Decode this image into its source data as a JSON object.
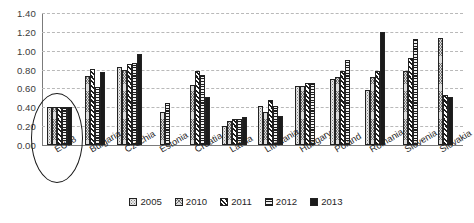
{
  "chart_data": {
    "type": "bar",
    "title": "",
    "xlabel": "",
    "ylabel": "",
    "ylim": [
      0.0,
      1.4
    ],
    "ytick_step": 0.2,
    "ytick_labels": [
      "0.00",
      "0.20",
      "0.40",
      "0.60",
      "0.80",
      "1.00",
      "1.20",
      "1.40"
    ],
    "grid": true,
    "legend_position": "bottom",
    "categories": [
      "EU28",
      "Bulgaria",
      "Czechia",
      "Estonia",
      "Croatia",
      "Latvia",
      "Lithuania",
      "Hungary",
      "Poland",
      "Romania",
      "Slovenia",
      "Slovakia"
    ],
    "series": [
      {
        "name": "2005",
        "color": "#e8e8e8",
        "pattern": "dotted",
        "values": [
          0.4,
          null,
          0.83,
          null,
          null,
          0.2,
          0.41,
          0.63,
          0.7,
          0.58,
          null,
          null
        ]
      },
      {
        "name": "2010",
        "color": "#dcdcdc",
        "pattern": "crosshatch",
        "values": [
          0.4,
          0.73,
          0.8,
          0.35,
          0.64,
          0.25,
          0.35,
          0.63,
          0.72,
          0.72,
          0.78,
          1.13
        ]
      },
      {
        "name": "2011",
        "color": "#ffffff",
        "pattern": "diagonal-stripe",
        "values": [
          0.4,
          0.81,
          0.86,
          null,
          0.78,
          0.28,
          0.48,
          0.66,
          0.78,
          0.79,
          0.92,
          0.53
        ]
      },
      {
        "name": "2012",
        "color": "#f2f2f2",
        "pattern": "horizontal-stripe",
        "values": [
          0.4,
          0.62,
          0.87,
          0.45,
          0.74,
          0.28,
          0.41,
          0.66,
          0.9,
          null,
          1.12,
          null
        ]
      },
      {
        "name": "2013",
        "color": "#1b1b1b",
        "pattern": "solid",
        "values": [
          0.4,
          0.77,
          0.97,
          null,
          0.51,
          0.3,
          0.31,
          null,
          null,
          1.2,
          null,
          0.51
        ]
      }
    ],
    "annotations": [
      {
        "type": "ellipse",
        "target": "EU28",
        "label": ""
      }
    ]
  }
}
